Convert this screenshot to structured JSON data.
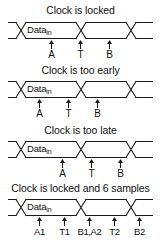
{
  "figure": {
    "signal_label": "Data",
    "signal_subscript": "in",
    "line_color": "#1a1a1a",
    "background_color": "#ffffff"
  },
  "panels": [
    {
      "id": "locked",
      "title": "Clock is locked",
      "signal_label": "Data",
      "signal_subscript": "in",
      "marks": [
        {
          "label": "A",
          "x_pct": 30
        },
        {
          "label": "T",
          "x_pct": 50
        },
        {
          "label": "B",
          "x_pct": 70
        }
      ]
    },
    {
      "id": "too-early",
      "title": "Clock is too early",
      "signal_label": "Data",
      "signal_subscript": "in",
      "marks": [
        {
          "label": "A",
          "x_pct": 22
        },
        {
          "label": "T",
          "x_pct": 42
        },
        {
          "label": "B",
          "x_pct": 62
        }
      ]
    },
    {
      "id": "too-late",
      "title": "Clock is too late",
      "signal_label": "Data",
      "signal_subscript": "in",
      "marks": [
        {
          "label": "A",
          "x_pct": 38
        },
        {
          "label": "T",
          "x_pct": 58
        },
        {
          "label": "B",
          "x_pct": 78
        }
      ]
    },
    {
      "id": "locked-6-samples",
      "title": "Clock is locked and 6 samples",
      "signal_label": "Data",
      "signal_subscript": "in",
      "marks": [
        {
          "label": "A1",
          "x_pct": 22
        },
        {
          "label": "T1",
          "x_pct": 40
        },
        {
          "label": "B1,A2",
          "x_pct": 57
        },
        {
          "label": "T2",
          "x_pct": 73
        },
        {
          "label": "B2",
          "x_pct": 90
        }
      ]
    }
  ]
}
